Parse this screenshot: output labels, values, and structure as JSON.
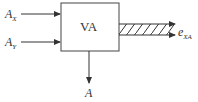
{
  "diagram": {
    "block": {
      "label": "VA"
    },
    "inputs": [
      {
        "symbol": "A",
        "subscript": "X"
      },
      {
        "symbol": "A",
        "subscript": "Y"
      }
    ],
    "output_bus": {
      "symbol": "e",
      "subscript": "XA"
    },
    "output_down": {
      "symbol": "A"
    },
    "colors": {
      "line": "#333333",
      "background": "#ffffff"
    }
  }
}
